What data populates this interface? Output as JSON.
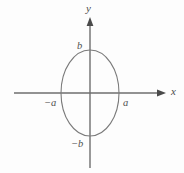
{
  "figure": {
    "kind": "ellipse-coordinate-diagram",
    "background_color": "#fdfdfd",
    "stroke_color": "#6e6e6e",
    "curve_color": "#7a7a7a",
    "text_color": "#4a4a4a",
    "axes": {
      "x_axis": {
        "label": "x",
        "arrow": "arrow-right",
        "start_px": 14,
        "end_px": 166,
        "y_px": 93
      },
      "y_axis": {
        "label": "y",
        "arrow": "arrow-up",
        "start_px": 168,
        "end_px": 17,
        "x_px": 90
      },
      "origin": {
        "x_px": 90,
        "y_px": 93
      }
    },
    "ellipse": {
      "center_x_px": 90,
      "center_y_px": 93,
      "semi_axis_x_px": 29,
      "semi_axis_y_px": 43,
      "semi_axis_x_label": "a",
      "semi_axis_y_label": "b"
    },
    "tick_labels": {
      "x_positive": "a",
      "x_negative": "−a",
      "y_positive": "b",
      "y_negative": "−b"
    }
  },
  "chart_data": {
    "type": "line",
    "title": "",
    "subtitle": "",
    "xlabel": "x",
    "ylabel": "y",
    "xlim": [
      -2.6,
      2.6
    ],
    "ylim": [
      -1.85,
      1.85
    ],
    "grid": false,
    "legend": null,
    "annotations": [
      {
        "text": "b",
        "x": 0,
        "y": 1,
        "position": "left-of-point"
      },
      {
        "text": "−b",
        "x": 0,
        "y": -1,
        "position": "left-of-point"
      },
      {
        "text": "a",
        "x": 1,
        "y": 0,
        "position": "below-right-of-point"
      },
      {
        "text": "−a",
        "x": -1,
        "y": 0,
        "position": "below-left-of-point"
      },
      {
        "text": "x",
        "x": 2.55,
        "y": 0,
        "position": "axis-end"
      },
      {
        "text": "y",
        "x": 0,
        "y": 1.8,
        "position": "axis-end"
      }
    ],
    "series": [
      {
        "name": "ellipse x^2/a^2 + y^2/b^2 = 1",
        "parametric": true,
        "semi_axis_x": 1,
        "semi_axis_y": 1,
        "center": [
          0,
          0
        ]
      }
    ]
  }
}
